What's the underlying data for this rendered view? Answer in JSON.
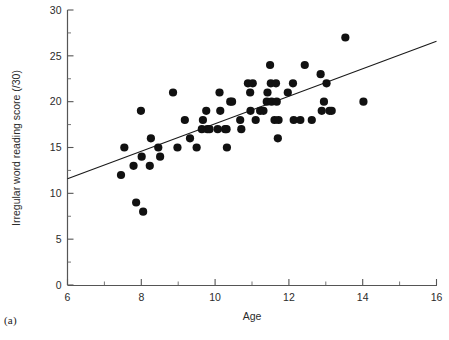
{
  "figure": {
    "panel_label": "(a)"
  },
  "chart_data": {
    "type": "scatter",
    "title": "",
    "xlabel": "Age",
    "ylabel": "Irregular word reading score (/30)",
    "xlim": [
      6,
      16
    ],
    "ylim": [
      0,
      30
    ],
    "x_ticks": [
      6,
      7,
      8,
      9,
      10,
      11,
      12,
      13,
      14,
      15,
      16
    ],
    "x_tick_labels": [
      "6",
      "",
      "8",
      "",
      "10",
      "",
      "12",
      "",
      "14",
      "",
      "16"
    ],
    "y_ticks": [
      0,
      2.5,
      5,
      7.5,
      10,
      12.5,
      15,
      17.5,
      20,
      22.5,
      25,
      27.5,
      30
    ],
    "y_tick_labels": [
      "0",
      "",
      "5",
      "",
      "10",
      "",
      "15",
      "",
      "20",
      "",
      "25",
      "",
      "30"
    ],
    "grid": false,
    "legend": null,
    "marker": {
      "shape": "circle",
      "color": "#111111",
      "size_px": 5.2
    },
    "points": [
      {
        "x": 7.45,
        "y": 12
      },
      {
        "x": 7.54,
        "y": 15
      },
      {
        "x": 7.79,
        "y": 13
      },
      {
        "x": 7.86,
        "y": 9
      },
      {
        "x": 7.99,
        "y": 19
      },
      {
        "x": 8.01,
        "y": 14
      },
      {
        "x": 8.05,
        "y": 8
      },
      {
        "x": 8.23,
        "y": 13
      },
      {
        "x": 8.26,
        "y": 16
      },
      {
        "x": 8.46,
        "y": 15
      },
      {
        "x": 8.51,
        "y": 14
      },
      {
        "x": 8.86,
        "y": 21
      },
      {
        "x": 8.98,
        "y": 15
      },
      {
        "x": 9.18,
        "y": 18
      },
      {
        "x": 9.32,
        "y": 16
      },
      {
        "x": 9.5,
        "y": 15
      },
      {
        "x": 9.64,
        "y": 17
      },
      {
        "x": 9.67,
        "y": 18
      },
      {
        "x": 9.76,
        "y": 19
      },
      {
        "x": 9.79,
        "y": 17
      },
      {
        "x": 9.85,
        "y": 17
      },
      {
        "x": 10.07,
        "y": 17
      },
      {
        "x": 10.12,
        "y": 21
      },
      {
        "x": 10.14,
        "y": 19
      },
      {
        "x": 10.27,
        "y": 17
      },
      {
        "x": 10.31,
        "y": 17
      },
      {
        "x": 10.32,
        "y": 15
      },
      {
        "x": 10.41,
        "y": 20
      },
      {
        "x": 10.46,
        "y": 20
      },
      {
        "x": 10.68,
        "y": 18
      },
      {
        "x": 10.71,
        "y": 17
      },
      {
        "x": 10.89,
        "y": 22
      },
      {
        "x": 10.95,
        "y": 21
      },
      {
        "x": 10.96,
        "y": 19
      },
      {
        "x": 11.02,
        "y": 22
      },
      {
        "x": 11.1,
        "y": 18
      },
      {
        "x": 11.22,
        "y": 19
      },
      {
        "x": 11.31,
        "y": 19
      },
      {
        "x": 11.4,
        "y": 20
      },
      {
        "x": 11.42,
        "y": 21
      },
      {
        "x": 11.49,
        "y": 24
      },
      {
        "x": 11.51,
        "y": 22
      },
      {
        "x": 11.53,
        "y": 20
      },
      {
        "x": 11.61,
        "y": 18
      },
      {
        "x": 11.65,
        "y": 22
      },
      {
        "x": 11.67,
        "y": 20
      },
      {
        "x": 11.7,
        "y": 16
      },
      {
        "x": 11.72,
        "y": 18
      },
      {
        "x": 11.97,
        "y": 21
      },
      {
        "x": 12.11,
        "y": 22
      },
      {
        "x": 12.13,
        "y": 18
      },
      {
        "x": 12.31,
        "y": 18
      },
      {
        "x": 12.43,
        "y": 24
      },
      {
        "x": 12.62,
        "y": 18
      },
      {
        "x": 12.86,
        "y": 23
      },
      {
        "x": 12.89,
        "y": 19
      },
      {
        "x": 12.95,
        "y": 20
      },
      {
        "x": 13.02,
        "y": 22
      },
      {
        "x": 13.1,
        "y": 19
      },
      {
        "x": 13.16,
        "y": 19
      },
      {
        "x": 13.53,
        "y": 27
      },
      {
        "x": 14.02,
        "y": 20
      }
    ],
    "fit_line": {
      "type": "linear-regression",
      "x_start": 6,
      "y_start": 11.6,
      "x_end": 16,
      "y_end": 26.6
    }
  }
}
